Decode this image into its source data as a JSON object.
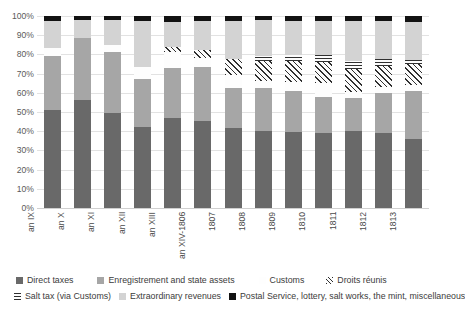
{
  "chart_data": {
    "type": "bar",
    "stacked": true,
    "stack_mode": "percent",
    "title": "",
    "xlabel": "",
    "ylabel": "",
    "ylim": [
      0,
      100
    ],
    "grid": true,
    "legend_position": "bottom",
    "categories": [
      "an IX",
      "an X",
      "an XI",
      "an XII",
      "an XIII",
      "an XIV-1806",
      "1807",
      "1808",
      "1809",
      "1810",
      "1811",
      "1812",
      "1813"
    ],
    "ytick_labels": [
      "0%",
      "10%",
      "20%",
      "30%",
      "40%",
      "50%",
      "60%",
      "70%",
      "80%",
      "90%",
      "100%"
    ],
    "ytick_values": [
      0,
      10,
      20,
      30,
      40,
      50,
      60,
      70,
      80,
      90,
      100
    ],
    "series": [
      {
        "name": "Direct taxes",
        "color": "#696969",
        "pattern": "solid",
        "values": [
          51,
          56,
          49.5,
          42,
          47,
          45.5,
          41.5,
          40,
          39.5,
          39,
          40,
          39,
          36
        ]
      },
      {
        "name": "Enregistrement and state assets",
        "color": "#a6a6a6",
        "pattern": "solid",
        "values": [
          28,
          32.5,
          32,
          25,
          26,
          28,
          21,
          22.5,
          21.5,
          19,
          17.5,
          21,
          25
        ]
      },
      {
        "name": "Customs",
        "color": "#fdfdfd",
        "pattern": "solid",
        "values": [
          4.5,
          0,
          3.5,
          6.5,
          8,
          4.5,
          7,
          3.5,
          4.5,
          7,
          3,
          3,
          3
        ]
      },
      {
        "name": "Droits réunis",
        "color": "#fbfbfb",
        "pattern": "diagonal-hatch",
        "values": [
          0,
          0,
          0,
          0,
          3,
          4.5,
          8,
          10.5,
          11,
          11,
          12,
          11,
          11
        ]
      },
      {
        "name": "Salt tax (via Customs)",
        "color": "#fbfbfb",
        "pattern": "horizontal-hatch",
        "values": [
          0,
          0,
          0,
          0,
          0,
          0,
          0,
          2.5,
          3,
          3.5,
          4,
          3.5,
          2
        ]
      },
      {
        "name": "Extraordinary revenues",
        "color": "#d3d3d3",
        "pattern": "solid",
        "values": [
          14,
          9.5,
          13,
          24,
          13,
          15,
          20,
          19,
          18,
          18,
          21,
          20,
          20
        ]
      },
      {
        "name": "Postal Service, lottery, salt works, the mint, miscellaneous",
        "color": "#121212",
        "pattern": "solid",
        "values": [
          2.5,
          2,
          2,
          2.5,
          3,
          2.5,
          2.5,
          2,
          2.5,
          2.5,
          2.5,
          2.5,
          3
        ]
      }
    ]
  },
  "legend": {
    "rows": [
      [
        "Direct taxes",
        "Enregistrement and state assets",
        "Customs",
        "Droits réunis"
      ],
      [
        "Salt tax (via Customs)",
        "Extraordinary revenues",
        "Postal Service, lottery, salt works, the mint, miscellaneous"
      ]
    ]
  }
}
